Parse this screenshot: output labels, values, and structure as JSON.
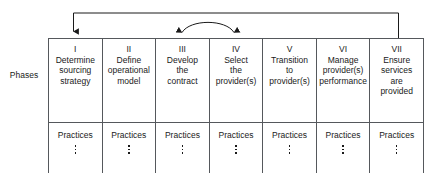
{
  "diagram": {
    "side_label": "Phases",
    "row_labels": {
      "practices": "Practices",
      "continuation": "vertical-ellipsis"
    },
    "phases": [
      {
        "numeral": "I",
        "title_lines": [
          "Determine",
          "sourcing",
          "strategy"
        ],
        "practices": "Practices"
      },
      {
        "numeral": "II",
        "title_lines": [
          "Define",
          "operational",
          "model"
        ],
        "practices": "Practices"
      },
      {
        "numeral": "III",
        "title_lines": [
          "Develop",
          "the",
          "contract"
        ],
        "practices": "Practices"
      },
      {
        "numeral": "IV",
        "title_lines": [
          "Select",
          "the",
          "provider(s)"
        ],
        "practices": "Practices"
      },
      {
        "numeral": "V",
        "title_lines": [
          "Transition",
          "to",
          "provider(s)"
        ],
        "practices": "Practices"
      },
      {
        "numeral": "VI",
        "title_lines": [
          "Manage",
          "provider(s)",
          "performance"
        ],
        "practices": "Practices"
      },
      {
        "numeral": "VII",
        "title_lines": [
          "Ensure",
          "services",
          "are",
          "provided"
        ],
        "practices": "Practices"
      }
    ],
    "connectors": [
      {
        "name": "feedback-loop-arrow",
        "from_phase": "VII",
        "to_phase": "I",
        "heads": "single",
        "direction": "right-to-left"
      },
      {
        "name": "iteration-arrow",
        "from_phase": "III",
        "to_phase": "IV",
        "heads": "double",
        "direction": "bidirectional"
      }
    ],
    "colors": {
      "line": "#55585c",
      "arrow": "#1a1a1a",
      "text": "#1a1a1a",
      "background": "#ffffff"
    }
  }
}
